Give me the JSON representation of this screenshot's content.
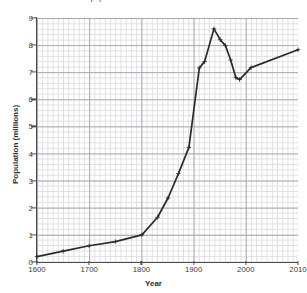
{
  "chart_data": {
    "type": "line",
    "title": "Growth of London's population",
    "xlabel": "Year",
    "ylabel": "Population (millions)",
    "xlim": [
      1600,
      2010
    ],
    "ylim": [
      0,
      9
    ],
    "grid": true,
    "grid_minor": true,
    "legend": "none",
    "marker": "plus",
    "line_color": "#2b2b2b",
    "grid_color": "#d8d8dd",
    "grid_major_color": "#9a9aa2",
    "xticks": [
      1600,
      1700,
      1800,
      1900,
      2000,
      2010
    ],
    "xtick_labels": [
      "1600",
      "1700",
      "1800",
      "1900",
      "2000",
      "2010"
    ],
    "yticks": [
      0,
      1,
      2,
      3,
      4,
      5,
      6,
      7,
      8,
      9
    ],
    "ytick_labels": [
      "0",
      "1",
      "2",
      "3",
      "4",
      "5",
      "6",
      "7",
      "8",
      "9"
    ],
    "x": [
      1600,
      1650,
      1700,
      1750,
      1801,
      1831,
      1851,
      1871,
      1891,
      1911,
      1921,
      1939,
      1951,
      1961,
      1971,
      1981,
      1988,
      2001,
      2010
    ],
    "values": [
      0.2,
      0.4,
      0.6,
      0.75,
      1.0,
      1.65,
      2.36,
      3.26,
      4.23,
      7.16,
      7.39,
      8.6,
      8.2,
      7.98,
      7.45,
      6.8,
      6.73,
      7.17,
      7.83
    ],
    "series": [
      {
        "name": "Population (millions)",
        "values": [
          0.2,
          0.4,
          0.6,
          0.75,
          1.0,
          1.65,
          2.36,
          3.26,
          4.23,
          7.16,
          7.39,
          8.6,
          8.2,
          7.98,
          7.45,
          6.8,
          6.73,
          7.17,
          7.83
        ]
      }
    ],
    "annotations": []
  }
}
